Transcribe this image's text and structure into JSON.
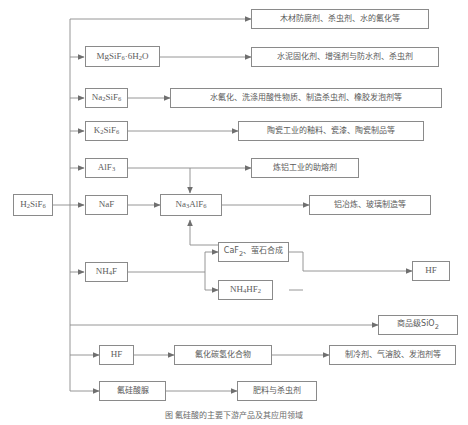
{
  "diagram": {
    "caption": "图 氟硅酸的主要下游产品及其应用领域",
    "source": {
      "id": "h2sif6",
      "label": "H2SiF6",
      "html": "H<sub>2</sub>SiF<sub>6</sub>"
    },
    "intermediates": [
      {
        "id": "mgsif6",
        "label": "MgSiF6 · 6H2O",
        "html": "MgSiF<sub>6</sub>&#183;6H<sub>2</sub>O"
      },
      {
        "id": "na2sif6",
        "label": "Na2SiF6",
        "html": "Na<sub>2</sub>SiF<sub>6</sub>"
      },
      {
        "id": "k2sif6",
        "label": "K2SiF6",
        "html": "K<sub>2</sub>SiF<sub>6</sub>"
      },
      {
        "id": "alf3",
        "label": "AlF3",
        "html": "AlF<sub>3</sub>"
      },
      {
        "id": "naf",
        "label": "NaF",
        "html": "NaF"
      },
      {
        "id": "na3alf6",
        "label": "Na3AlF6",
        "html": "Na<sub>3</sub>AlF<sub>6</sub>"
      },
      {
        "id": "nh4f",
        "label": "NH4F",
        "html": "NH<sub>4</sub>F"
      },
      {
        "id": "caf2",
        "label": "CaF2、萤石合成",
        "html": "CaF<sub>2</sub>、萤石合成"
      },
      {
        "id": "nh4hf2",
        "label": "NH4HF2",
        "html": "NH<sub>4</sub>HF<sub>2</sub>"
      },
      {
        "id": "hf_right",
        "label": "HF",
        "html": "HF"
      },
      {
        "id": "hf_low",
        "label": "HF",
        "html": "HF"
      },
      {
        "id": "fluorocarbon",
        "label": "氟化碳氢化合物",
        "html": "氟化碳氢化合物"
      },
      {
        "id": "fsi_urea",
        "label": "氟硅酸脲",
        "html": "氟硅酸脲"
      }
    ],
    "applications": [
      {
        "id": "app_wood",
        "label": "木材防腐剂、杀虫剂、水的氟化等",
        "html": "木材防腐剂、杀虫剂、水的氟化等"
      },
      {
        "id": "app_cement",
        "label": "水泥固化剂、增强剂与防水剂、杀虫剂",
        "html": "水泥固化剂、增强剂与防水剂、杀虫剂"
      },
      {
        "id": "app_water",
        "label": "水氟化、洗涤用酸性物质、制造杀虫剂、橡胶发泡剂等",
        "html": "水氟化、洗涤用酸性物质、制造杀虫剂、橡胶发泡剂等"
      },
      {
        "id": "app_ceramic",
        "label": "陶瓷工业的釉料、瓷漆、陶瓷制品等",
        "html": "陶瓷工业的釉料、瓷漆、陶瓷制品等"
      },
      {
        "id": "app_alumina",
        "label": "炼铝工业的助熔剂",
        "html": "炼铝工业的助熔剂"
      },
      {
        "id": "app_smelt",
        "label": "铝冶炼、玻璃制造等",
        "html": "铝冶炼、玻璃制造等"
      },
      {
        "id": "app_sio2",
        "label": "商品级SiO2",
        "html": "商品级SiO<sub>2</sub>"
      },
      {
        "id": "app_refrig",
        "label": "制冷剂、气溶胶、发泡剂等",
        "html": "制冷剂、气溶胶、发泡剂等"
      },
      {
        "id": "app_fert",
        "label": "肥料与杀虫剂",
        "html": "肥料与杀虫剂"
      }
    ],
    "colors": {
      "border": "#8a8a8a",
      "text": "#5d5d5d",
      "wire": "#8a8a8a",
      "background": "#ffffff"
    }
  }
}
